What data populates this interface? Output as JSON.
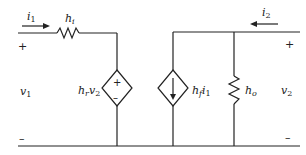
{
  "diagram": {
    "type": "circuit",
    "colors": {
      "wire": "#222222",
      "background": "#ffffff"
    },
    "input_port": {
      "current_label": "i",
      "current_sub": "1",
      "voltage_label": "v",
      "voltage_sub": "1",
      "plus": "+",
      "minus": "–"
    },
    "output_port": {
      "current_label": "i",
      "current_sub": "2",
      "voltage_label": "v",
      "voltage_sub": "2",
      "plus": "+",
      "minus": "–"
    },
    "components": {
      "input_resistor": {
        "label": "h",
        "sub": "i"
      },
      "dependent_voltage_source": {
        "label_h": "h",
        "label_sub": "r",
        "label_v": "v",
        "label_vsub": "2",
        "plus": "+",
        "minus": "–"
      },
      "dependent_current_source": {
        "label_h": "h",
        "label_sub": "f",
        "label_i": "i",
        "label_isub": "1"
      },
      "output_resistor": {
        "label": "h",
        "sub": "o"
      }
    }
  }
}
